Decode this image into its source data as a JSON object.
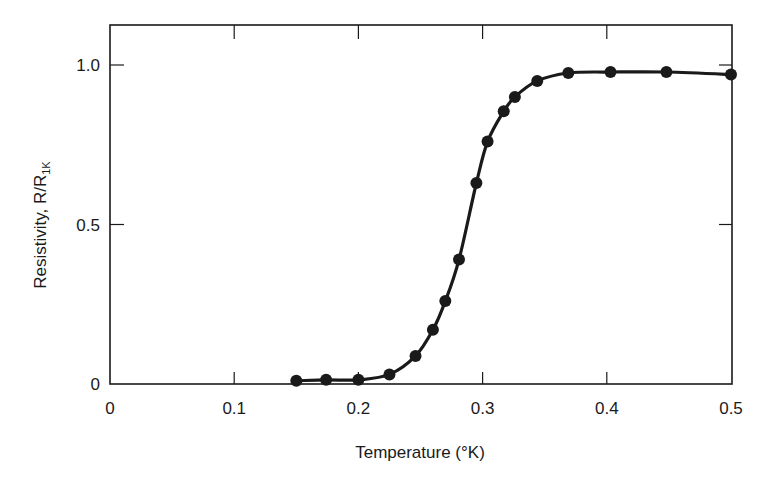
{
  "chart_data": {
    "type": "line",
    "title": "",
    "xlabel": "Temperature (°K)",
    "ylabel": "Resistivity, R/R1K",
    "ylabel_parts": {
      "main": "Resistivity, R/R",
      "subscript": "1K"
    },
    "xlim": [
      0,
      0.5
    ],
    "ylim": [
      0,
      1.1
    ],
    "x_ticks": [
      0,
      0.1,
      0.2,
      0.3,
      0.4,
      0.5
    ],
    "x_tick_labels": [
      "0",
      "0.1",
      "0.2",
      "0.3",
      "0.4",
      "0.5"
    ],
    "y_ticks": [
      0,
      0.5,
      1.0
    ],
    "y_tick_labels": [
      "0",
      "0.5",
      "1.0"
    ],
    "grid": false,
    "legend": null,
    "marker": "filled-circle",
    "line_style": "smooth solid",
    "series": [
      {
        "name": "Resistivity",
        "color": "#1a1a1a",
        "x": [
          0.15,
          0.174,
          0.2,
          0.225,
          0.246,
          0.26,
          0.27,
          0.281,
          0.295,
          0.304,
          0.317,
          0.326,
          0.344,
          0.369,
          0.403,
          0.448,
          0.5
        ],
        "y": [
          0.01,
          0.013,
          0.013,
          0.03,
          0.088,
          0.17,
          0.26,
          0.39,
          0.63,
          0.76,
          0.855,
          0.9,
          0.95,
          0.975,
          0.978,
          0.978,
          0.97
        ]
      }
    ]
  },
  "layout": {
    "plot_left": 110,
    "plot_right": 732,
    "plot_top": 25,
    "plot_bottom": 384,
    "y_unit_px": 319
  }
}
